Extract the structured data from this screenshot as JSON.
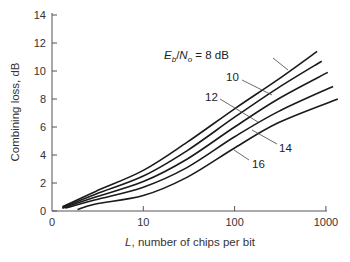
{
  "chart_data": {
    "type": "line",
    "title": "",
    "xlabel": "L, number of chips per bit",
    "ylabel": "Combining loss, dB",
    "x_scale": "log",
    "xlim": [
      1,
      1000
    ],
    "ylim": [
      0,
      14
    ],
    "x_ticks": [
      1,
      10,
      100,
      1000
    ],
    "x_tick_labels": [
      "0",
      "10",
      "100",
      "1000"
    ],
    "y_ticks": [
      0,
      2,
      4,
      6,
      8,
      10,
      12,
      14
    ],
    "y_tick_labels": [
      "0",
      "2",
      "4",
      "6",
      "8",
      "10",
      "12",
      "14"
    ],
    "grid": false,
    "legend_position": "inline labels with leader lines",
    "annotation_prefix": "E_b/N_o =",
    "series": [
      {
        "name": "Eb/No = 8 dB",
        "label": "Eb/No = 8 dB",
        "x": [
          1.3,
          3,
          10,
          30,
          100,
          300,
          800
        ],
        "y": [
          0.3,
          1.4,
          2.9,
          4.9,
          7.3,
          9.4,
          11.4
        ]
      },
      {
        "name": "10 dB",
        "label": "10",
        "x": [
          1.3,
          3,
          10,
          30,
          100,
          300,
          900
        ],
        "y": [
          0.25,
          1.2,
          2.5,
          4.3,
          6.7,
          8.8,
          10.7
        ]
      },
      {
        "name": "12 dB",
        "label": "12",
        "x": [
          1.3,
          3,
          10,
          30,
          100,
          300,
          1050
        ],
        "y": [
          0.2,
          1.0,
          2.1,
          3.7,
          6.0,
          8.0,
          9.9
        ]
      },
      {
        "name": "14 dB",
        "label": "14",
        "x": [
          1.4,
          3,
          10,
          30,
          100,
          300,
          1200
        ],
        "y": [
          0.2,
          0.8,
          1.7,
          3.1,
          5.3,
          7.1,
          8.9
        ]
      },
      {
        "name": "16 dB",
        "label": "16",
        "x": [
          1.9,
          3,
          10,
          30,
          100,
          300,
          1350
        ],
        "y": [
          0.1,
          0.5,
          1.1,
          2.4,
          4.5,
          6.3,
          8.0
        ]
      }
    ]
  },
  "labels": {
    "ylabel": "Combining loss, dB",
    "xlabel_italic": "L",
    "xlabel_rest": ", number of chips per bit",
    "eb": "E",
    "eb_sub": "b",
    "slash": "/",
    "no": "N",
    "no_sub": "o",
    "eq8": " = 8 dB",
    "l10": "10",
    "l12": "12",
    "l14": "14",
    "l16": "16"
  }
}
